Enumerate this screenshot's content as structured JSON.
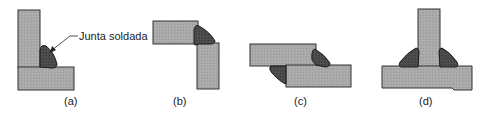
{
  "figure": {
    "annotation": "Junta soldada",
    "panels": [
      {
        "id": "a",
        "label": "(a)"
      },
      {
        "id": "b",
        "label": "(b)"
      },
      {
        "id": "c",
        "label": "(c)"
      },
      {
        "id": "d",
        "label": "(d)"
      }
    ],
    "colors": {
      "plate_fill": "#a9a9a9",
      "plate_stroke": "#333333",
      "weld_fill": "#4a4a4a",
      "weld_stroke": "#1a1a1a"
    }
  }
}
